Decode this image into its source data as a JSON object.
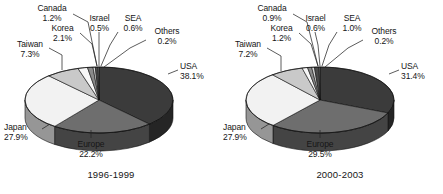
{
  "figure": {
    "background": "#ffffff",
    "text_color": "#161616"
  },
  "chart_data": [
    {
      "type": "pie",
      "title": "1996-1999",
      "caption": "1996-1999",
      "categories": [
        "USA",
        "Europe",
        "Japan",
        "Taiwan",
        "Korea",
        "Canada",
        "Israel",
        "SEA",
        "Others"
      ],
      "values": [
        38.1,
        22.2,
        27.9,
        7.3,
        2.1,
        1.2,
        0.5,
        0.6,
        0.2
      ],
      "unit": "%",
      "labels": [
        "38.1%",
        "22.2%",
        "27.9%",
        "7.3%",
        "2.1%",
        "1.2%",
        "0.5%",
        "0.6%",
        "0.2%"
      ],
      "slice_colors": [
        "#3b3b3b",
        "#6e6e6e",
        "#f2f2f2",
        "#c9c9c9",
        "#f7f7f7",
        "#8a8a8a",
        "#d6d6d6",
        "#4a4a4a",
        "#9a9a9a"
      ],
      "legend": "none",
      "grid": false,
      "three_d": true
    },
    {
      "type": "pie",
      "title": "2000-2003",
      "caption": "2000-2003",
      "categories": [
        "USA",
        "Europe",
        "Japan",
        "Taiwan",
        "Korea",
        "Canada",
        "Israel",
        "SEA",
        "Others"
      ],
      "values": [
        31.4,
        29.5,
        27.9,
        7.2,
        1.2,
        0.9,
        0.6,
        1.0,
        0.2
      ],
      "unit": "%",
      "labels": [
        "31.4%",
        "29.5%",
        "27.9%",
        "7.2%",
        "1.2%",
        "0.9%",
        "0.6%",
        "1.0%",
        "0.2%"
      ],
      "slice_colors": [
        "#3b3b3b",
        "#6e6e6e",
        "#f2f2f2",
        "#c9c9c9",
        "#f7f7f7",
        "#8a8a8a",
        "#d6d6d6",
        "#4a4a4a",
        "#9a9a9a"
      ],
      "legend": "none",
      "grid": false,
      "three_d": true
    }
  ],
  "left": {
    "caption": "1996-1999",
    "labels": {
      "usa_name": "USA",
      "usa_val": "38.1%",
      "europe_name": "Europe",
      "europe_val": "22.2%",
      "japan_name": "Japan",
      "japan_val": "27.9%",
      "taiwan_name": "Taiwan",
      "taiwan_val": "7.3%",
      "korea_name": "Korea",
      "korea_val": "2.1%",
      "canada_name": "Canada",
      "canada_val": "1.2%",
      "israel_name": "Israel",
      "israel_val": "0.5%",
      "sea_name": "SEA",
      "sea_val": "0.6%",
      "others_name": "Others",
      "others_val": "0.2%"
    }
  },
  "right": {
    "caption": "2000-2003",
    "labels": {
      "usa_name": "USA",
      "usa_val": "31.4%",
      "europe_name": "Europe",
      "europe_val": "29.5%",
      "japan_name": "Japan",
      "japan_val": "27.9%",
      "taiwan_name": "Taiwan",
      "taiwan_val": "7.2%",
      "korea_name": "Korea",
      "korea_val": "1.2%",
      "canada_name": "Canada",
      "canada_val": "0.9%",
      "israel_name": "Israel",
      "israel_val": "0.6%",
      "sea_name": "SEA",
      "sea_val": "1.0%",
      "others_name": "Others",
      "others_val": "0.2%"
    }
  }
}
